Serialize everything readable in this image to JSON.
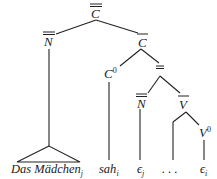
{
  "diagram": {
    "type": "syntax-tree",
    "colors": {
      "ink": "#222222",
      "background": "#ffffff"
    },
    "nodes": {
      "root": {
        "label": "C",
        "bar": "double"
      },
      "np": {
        "label": "N",
        "bar": "double"
      },
      "cbar": {
        "label": "C",
        "bar": "single"
      },
      "c0": {
        "label": "C",
        "superscript": "0"
      },
      "ip": {
        "label": "",
        "bar": "double"
      },
      "np2": {
        "label": "N",
        "bar": "double"
      },
      "vbar": {
        "label": "V",
        "bar": "single"
      },
      "v0": {
        "label": "V",
        "superscript": "0"
      }
    },
    "leaves": {
      "das_maedchen": {
        "text": "Das Mädchen",
        "subscript": "j"
      },
      "sah": {
        "text": "sah",
        "subscript": "i"
      },
      "trace_j": {
        "text": "ϵ",
        "subscript": "j"
      },
      "ellipsis": {
        "text": ". . ."
      },
      "trace_i": {
        "text": "ϵ",
        "subscript": "i"
      }
    }
  }
}
